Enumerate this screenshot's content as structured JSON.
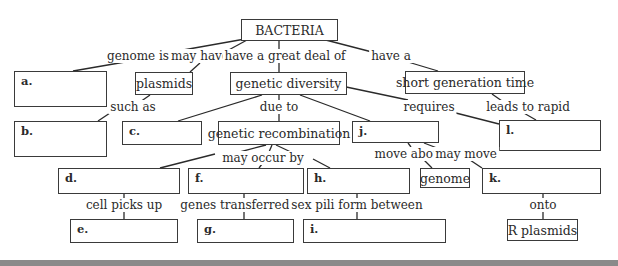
{
  "diagram": {
    "type": "concept-map",
    "root": "BACTERIA",
    "nodes": {
      "bacteria": "BACTERIA",
      "plasmids": "plasmids",
      "genetic_diversity": "genetic diversity",
      "short_generation_time": "short generation time",
      "genetic_recombination": "genetic recombination",
      "genome": "genome",
      "r_plasmids": "R plasmids"
    },
    "blanks": {
      "a": "a.",
      "b": "b.",
      "c": "c.",
      "d": "d.",
      "e": "e.",
      "f": "f.",
      "g": "g.",
      "h": "h.",
      "i": "i.",
      "j": "j.",
      "k": "k.",
      "l": "l."
    },
    "links": {
      "genome_is": "genome is",
      "may_have": "may have",
      "great_deal": "have a great deal of",
      "have_a": "have a",
      "such_as": "such as",
      "due_to": "due to",
      "requires": "requires",
      "leads_to_rapid": "leads to rapid",
      "may_occur_by": "may occur by",
      "move_about": "move about",
      "may_move": "may move",
      "cell_picks_up": "cell picks up",
      "genes_transferred_by": "genes transferred by",
      "sex_pili": "sex pili form between",
      "onto": "onto"
    }
  }
}
